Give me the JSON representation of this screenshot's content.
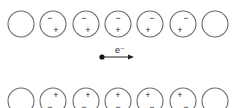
{
  "diagram": {
    "title": "",
    "atom_centers_x": [
      21,
      53,
      86,
      118,
      150,
      183,
      215
    ],
    "atom_radius": 13,
    "top_row": {
      "y": 24,
      "atoms": [
        {
          "polarized": false
        },
        {
          "polarized": true,
          "minus": {
            "dx": -3,
            "dy": -6
          },
          "plus": {
            "dx": 3,
            "dy": 6
          }
        },
        {
          "polarized": true,
          "minus": {
            "dx": -2,
            "dy": -6
          },
          "plus": {
            "dx": 2,
            "dy": 6
          }
        },
        {
          "polarized": true,
          "minus": {
            "dx": 0,
            "dy": -6
          },
          "plus": {
            "dx": 0,
            "dy": 6
          }
        },
        {
          "polarized": true,
          "minus": {
            "dx": 2,
            "dy": -6
          },
          "plus": {
            "dx": -2,
            "dy": 6
          }
        },
        {
          "polarized": true,
          "minus": {
            "dx": 3,
            "dy": -6
          },
          "plus": {
            "dx": -3,
            "dy": 6
          }
        },
        {
          "polarized": false
        }
      ]
    },
    "bottom_row": {
      "y": 101,
      "atoms": [
        {
          "polarized": false
        },
        {
          "polarized": true,
          "plus": {
            "dx": 3,
            "dy": -6
          },
          "minus": {
            "dx": -3,
            "dy": 6
          }
        },
        {
          "polarized": true,
          "plus": {
            "dx": 2,
            "dy": -6
          },
          "minus": {
            "dx": -2,
            "dy": 6
          }
        },
        {
          "polarized": true,
          "plus": {
            "dx": 0,
            "dy": -6
          },
          "minus": {
            "dx": 0,
            "dy": 6
          }
        },
        {
          "polarized": true,
          "plus": {
            "dx": -2,
            "dy": -6
          },
          "minus": {
            "dx": 2,
            "dy": 6
          }
        },
        {
          "polarized": true,
          "plus": {
            "dx": -3,
            "dy": -6
          },
          "minus": {
            "dx": 3,
            "dy": 6
          }
        },
        {
          "polarized": false
        }
      ]
    },
    "plus_symbol": "+",
    "minus_symbol": "−",
    "electron": {
      "label": "e⁻",
      "x": 102,
      "y": 57,
      "arrow_to_x": 134
    }
  }
}
